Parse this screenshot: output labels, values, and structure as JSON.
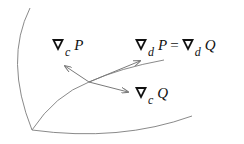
{
  "diagram": {
    "labels": {
      "grad_c_P": {
        "operator": "∇",
        "subscript": "c",
        "var": "P"
      },
      "grad_d_eq": {
        "operator": "∇",
        "subscript_left": "d",
        "var_left": "P",
        "equals": "=",
        "subscript_right": "d",
        "var_right": "Q"
      },
      "grad_c_Q": {
        "operator": "∇",
        "subscript": "c",
        "var": "Q"
      }
    },
    "curves": [
      "left-boundary-curve",
      "bottom-boundary-curve",
      "middle-curve"
    ],
    "arrows": [
      "arrow-grad-c-P",
      "arrow-grad-d",
      "arrow-grad-c-Q"
    ],
    "colors": {
      "line": "#8a8a8a",
      "text": "#111111"
    }
  }
}
